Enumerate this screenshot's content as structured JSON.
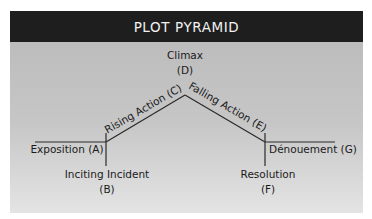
{
  "title": "PLOT PYRAMID",
  "nodes": {
    "climax": {
      "label": "Climax",
      "letter": "(D)"
    },
    "rising_action": {
      "label": "Rising Action (C)"
    },
    "falling_action": {
      "label": "Falling Action (E)"
    },
    "exposition": {
      "label": "Exposition (A)"
    },
    "inciting_incident": {
      "label": "Inciting Incident",
      "letter": "(B)"
    },
    "resolution": {
      "label": "Resolution",
      "letter": "(F)"
    },
    "denouement": {
      "label": "Dénouement (G)"
    }
  },
  "colors": {
    "header_bg": "#1e1e1e",
    "header_text": "#f2f2f2",
    "line": "#2a2a2a"
  }
}
